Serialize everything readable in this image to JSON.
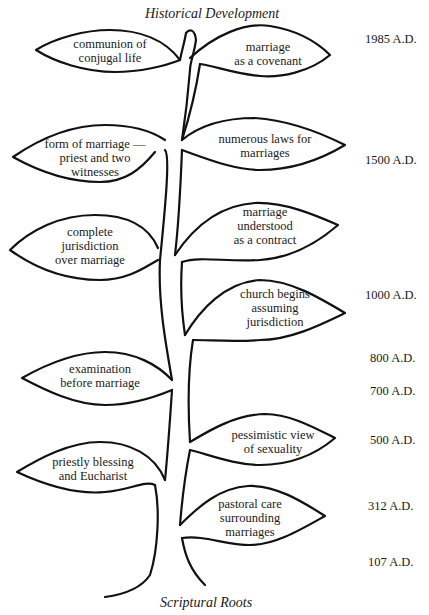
{
  "top_title": "Historical Development",
  "bottom_title": "Scriptural Roots",
  "leaves": {
    "communion": [
      "communion of",
      "conjugal life"
    ],
    "covenant": [
      "marriage",
      "as a covenant"
    ],
    "form": [
      "form of marriage —",
      "priest and two",
      "witnesses"
    ],
    "laws": [
      "numerous laws for",
      "marriages"
    ],
    "jurisdiction_complete": [
      "complete",
      "jurisdiction",
      "over marriage"
    ],
    "contract": [
      "marriage",
      "understood",
      "as a contract"
    ],
    "church_begins": [
      "church begins",
      "assuming",
      "jurisdiction"
    ],
    "examination": [
      "examination",
      "before marriage"
    ],
    "pessimistic": [
      "pessimistic view",
      "of sexuality"
    ],
    "blessing": [
      "priestly blessing",
      "and Eucharist"
    ],
    "pastoral": [
      "pastoral care",
      "surrounding",
      "marriages"
    ]
  },
  "dates": [
    "1985 A.D.",
    "1500 A.D.",
    "1000 A.D.",
    "800 A.D.",
    "700 A.D.",
    "500 A.D.",
    "312 A.D.",
    "107 A.D."
  ]
}
